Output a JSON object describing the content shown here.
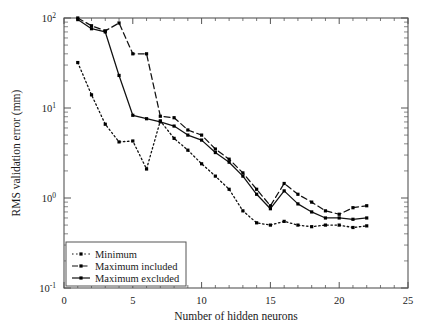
{
  "chart_data": {
    "type": "line",
    "title": "",
    "xlabel": "Number of hidden neurons",
    "ylabel": "RMS validation error (mm)",
    "xlim": [
      0,
      25
    ],
    "ylim": [
      0.1,
      100
    ],
    "yscale": "log",
    "xscale": "linear",
    "grid": false,
    "legend_position": "lower-left-inside",
    "xticks": [
      0,
      5,
      10,
      15,
      20,
      25
    ],
    "xtick_labels": [
      "0",
      "5",
      "10",
      "15",
      "20",
      "25"
    ],
    "yticks": [
      0.1,
      1,
      10,
      100
    ],
    "ytick_labels": [
      "10",
      "10",
      "10",
      "10"
    ],
    "ytick_exponents": [
      "-1",
      "0",
      "1",
      "2"
    ],
    "series": [
      {
        "name": "Minimum",
        "style": "dotted",
        "marker": "square",
        "x": [
          1,
          2,
          3,
          4,
          5,
          6,
          7,
          8,
          9,
          10,
          11,
          12,
          13,
          14,
          15,
          16,
          17,
          18,
          19,
          20,
          21,
          22
        ],
        "values": [
          32.0,
          14.0,
          6.6,
          4.2,
          4.3,
          2.1,
          7.2,
          4.6,
          3.4,
          2.4,
          1.75,
          1.25,
          0.72,
          0.53,
          0.5,
          0.55,
          0.5,
          0.48,
          0.5,
          0.5,
          0.47,
          0.49
        ]
      },
      {
        "name": "Maximum included",
        "style": "dashed",
        "marker": "square",
        "x": [
          1,
          2,
          3,
          4,
          5,
          6,
          7,
          8,
          9,
          10,
          11,
          12,
          13,
          14,
          15,
          16,
          17,
          18,
          19,
          20,
          21,
          22
        ],
        "values": [
          100.0,
          82.0,
          72.0,
          88.0,
          40.0,
          40.0,
          8.1,
          7.8,
          5.7,
          5.0,
          3.5,
          2.7,
          1.9,
          1.25,
          0.82,
          1.45,
          1.1,
          0.9,
          0.72,
          0.66,
          0.78,
          0.82
        ]
      },
      {
        "name": "Maximum excluded",
        "style": "solid",
        "marker": "square",
        "x": [
          1,
          2,
          3,
          4,
          5,
          6,
          7,
          8,
          9,
          10,
          11,
          12,
          13,
          14,
          15,
          16,
          17,
          18,
          19,
          20,
          21,
          22
        ],
        "values": [
          96.0,
          76.0,
          70.0,
          23.0,
          8.3,
          7.6,
          7.0,
          6.3,
          5.0,
          4.4,
          3.2,
          2.5,
          1.75,
          1.1,
          0.76,
          1.2,
          0.86,
          0.7,
          0.6,
          0.6,
          0.58,
          0.6
        ]
      }
    ],
    "legend_entries": [
      {
        "label": "Minimum",
        "style": "dotted"
      },
      {
        "label": "Maximum included",
        "style": "dashed"
      },
      {
        "label": "Maximum excluded",
        "style": "solid"
      }
    ],
    "colors": {
      "line": "#111111",
      "axis": "#555555",
      "background": "#ffffff",
      "marker": "#000000"
    }
  }
}
